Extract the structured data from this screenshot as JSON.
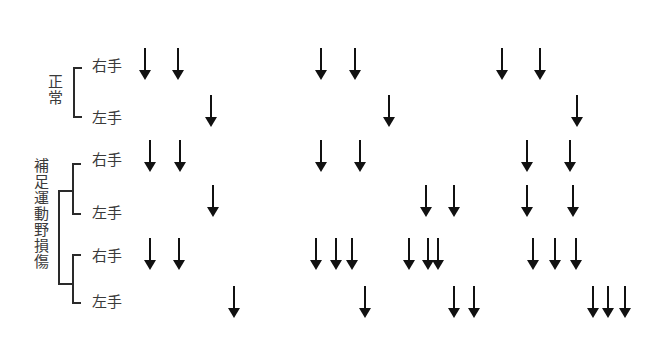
{
  "groups": [
    {
      "label": "正常",
      "rows": [
        {
          "hand": "右手",
          "arrows_x": [
            145,
            178,
            321,
            355,
            502,
            540
          ]
        },
        {
          "hand": "左手",
          "arrows_x": [
            211,
            389,
            577
          ]
        }
      ]
    },
    {
      "label": "補足運動野損傷",
      "rows": [
        {
          "hand": "右手",
          "arrows_x": [
            150,
            180,
            321,
            360,
            527,
            570
          ]
        },
        {
          "hand": "左手",
          "arrows_x": [
            213,
            426,
            454,
            527,
            573
          ]
        },
        {
          "hand": "右手",
          "arrows_x": [
            150,
            179,
            316,
            336,
            352,
            409,
            428,
            438,
            533,
            555,
            576
          ]
        },
        {
          "hand": "左手",
          "arrows_x": [
            234,
            365,
            454,
            474,
            593,
            608,
            625
          ]
        }
      ]
    }
  ],
  "layout": {
    "row_arrow_top": [
      48,
      95,
      140,
      185,
      238,
      286
    ],
    "row_label_y": [
      57,
      109,
      151,
      204,
      247,
      293
    ]
  },
  "colors": {
    "arrow": "#111111",
    "text": "#3a3a3a"
  }
}
